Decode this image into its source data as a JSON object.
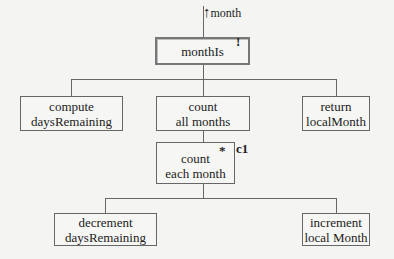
{
  "diagram": {
    "type": "structure-chart",
    "input_flow": {
      "arrow": "↑",
      "label": "month"
    },
    "root": {
      "label": "monthIs",
      "marker": "!"
    },
    "level1": [
      {
        "line1": "compute",
        "line2": "daysRemaining"
      },
      {
        "line1": "count",
        "line2": "all months"
      },
      {
        "line1": "return",
        "line2": "localMonth"
      }
    ],
    "loop": {
      "line1": "count",
      "line2": "each month",
      "marker": "*",
      "condition": "c1"
    },
    "level2": [
      {
        "line1": "decrement",
        "line2": "daysRemaining"
      },
      {
        "line1": "increment",
        "line2": "local Month"
      }
    ]
  }
}
